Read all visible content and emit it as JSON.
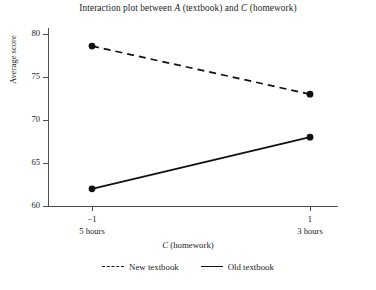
{
  "chart_data": {
    "type": "line",
    "title": "Interaction plot between A (textbook) and C (homework)",
    "title_parts": {
      "pre": "Interaction plot between ",
      "factor_a": "A",
      "mid": " (textbook) and ",
      "factor_c": "C",
      "post": " (homework)"
    },
    "xlabel": "C (homework)",
    "xlabel_parts": {
      "symbol": "C",
      "text": " (homework)"
    },
    "ylabel": "Average score",
    "categories": [
      "-1",
      "1"
    ],
    "x": [
      -1,
      1
    ],
    "xtick_labels": [
      "−1",
      "1"
    ],
    "xtick_sublabels": [
      "5 hours",
      "3 hours"
    ],
    "ytick_labels": [
      "60",
      "65",
      "70",
      "75",
      "80"
    ],
    "yticks": [
      60,
      65,
      70,
      75,
      80
    ],
    "ylim": [
      59,
      81
    ],
    "xlim": [
      -1.35,
      1.35
    ],
    "grid": false,
    "legend_position": "bottom-center",
    "series": [
      {
        "name": "New textbook",
        "style": "dashed",
        "color": "#111111",
        "values": [
          78.6,
          73.0
        ]
      },
      {
        "name": "Old textbook",
        "style": "solid",
        "color": "#111111",
        "values": [
          62.0,
          68.0
        ]
      }
    ]
  },
  "legend": {
    "items": [
      {
        "label": "New textbook",
        "style": "dashed"
      },
      {
        "label": "Old textbook",
        "style": "solid"
      }
    ]
  }
}
